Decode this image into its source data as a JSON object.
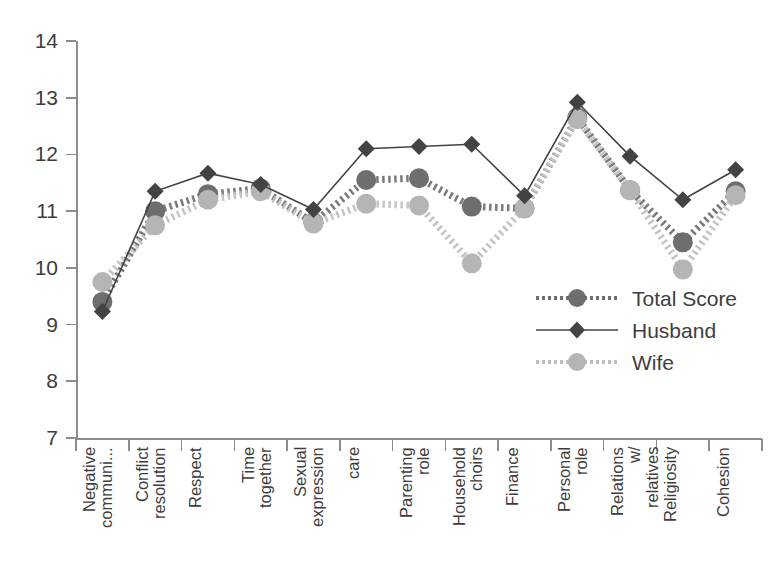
{
  "chart_data": {
    "type": "line",
    "title": "",
    "xlabel": "",
    "ylabel": "",
    "ylim": [
      7,
      14
    ],
    "yticks": [
      7,
      8,
      9,
      10,
      11,
      12,
      13,
      14
    ],
    "grid": false,
    "legend_position": "center-right",
    "categories": [
      "Negative communi...",
      "Conflict resolution",
      "Respect",
      "Time together",
      "Sexual expression",
      "care",
      "Parenting role",
      "Household choirs",
      "Finance",
      "Personal role",
      "Relations w/ relatives",
      "Religiosity",
      "Cohesion"
    ],
    "series": [
      {
        "name": "Total Score",
        "color": "#6e6e6e",
        "marker": "circle",
        "line_style": "dotted",
        "values": [
          9.4,
          11.0,
          11.3,
          11.4,
          10.8,
          11.55,
          11.58,
          11.08,
          11.05,
          12.65,
          11.37,
          10.45,
          11.35
        ]
      },
      {
        "name": "Husband",
        "color": "#434343",
        "marker": "diamond",
        "line_style": "solid",
        "values": [
          9.23,
          11.35,
          11.67,
          11.47,
          11.03,
          12.1,
          12.14,
          12.18,
          11.27,
          12.92,
          11.97,
          11.2,
          11.73
        ]
      },
      {
        "name": "Wife",
        "color": "#b5b5b5",
        "marker": "circle",
        "line_style": "dotted",
        "values": [
          9.75,
          10.75,
          11.2,
          11.35,
          10.78,
          11.13,
          11.1,
          10.08,
          11.05,
          12.62,
          11.37,
          9.97,
          11.28
        ]
      }
    ]
  },
  "legend": {
    "items": [
      {
        "label": "Total Score"
      },
      {
        "label": "Husband"
      },
      {
        "label": "Wife"
      }
    ]
  },
  "axis": {
    "y_tick_labels": [
      "14",
      "13",
      "12",
      "11",
      "10",
      "9",
      "8",
      "7"
    ]
  }
}
